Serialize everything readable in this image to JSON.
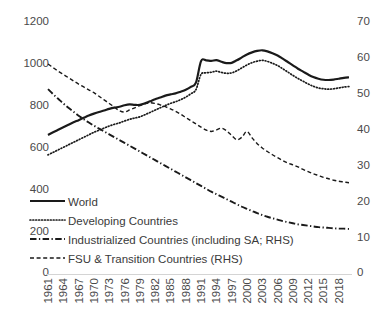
{
  "chart_data": {
    "type": "line",
    "title": "",
    "xlabel": "",
    "ylabel": "",
    "y2label": "",
    "ylim": [
      0,
      1200
    ],
    "y2lim": [
      0,
      70
    ],
    "grid": false,
    "legend_position": "inside-lower-left",
    "x": [
      1961,
      1962,
      1963,
      1964,
      1965,
      1966,
      1967,
      1968,
      1969,
      1970,
      1971,
      1972,
      1973,
      1974,
      1975,
      1976,
      1977,
      1978,
      1979,
      1980,
      1981,
      1982,
      1983,
      1984,
      1985,
      1986,
      1987,
      1988,
      1989,
      1990,
      1991,
      1992,
      1993,
      1994,
      1995,
      1996,
      1997,
      1998,
      1999,
      2000,
      2001,
      2002,
      2003,
      2004,
      2005,
      2006,
      2007,
      2008,
      2009,
      2010,
      2011,
      2012,
      2013,
      2014,
      2015,
      2016,
      2017,
      2018,
      2019,
      2020
    ],
    "tick_labels_x": [
      "1961",
      "1964",
      "1967",
      "1970",
      "1973",
      "1976",
      "1979",
      "1982",
      "1985",
      "1988",
      "1991",
      "1994",
      "1997",
      "2000",
      "2003",
      "2006",
      "2009",
      "2012",
      "2015",
      "2018"
    ],
    "tick_labels_y_left": [
      "1200",
      "1000",
      "800",
      "600",
      "400",
      "200",
      "0"
    ],
    "tick_labels_y_right": [
      "70",
      "60",
      "50",
      "40",
      "30",
      "20",
      "10",
      "0"
    ],
    "series": [
      {
        "name": "World",
        "axis": "left",
        "style": "solid",
        "values": [
          655,
          668,
          680,
          692,
          704,
          716,
          726,
          737,
          748,
          757,
          765,
          772,
          780,
          786,
          790,
          797,
          801,
          799,
          799,
          806,
          816,
          826,
          834,
          843,
          849,
          854,
          862,
          871,
          885,
          905,
          1008,
          1012,
          1009,
          1013,
          1005,
          999,
          1000,
          1012,
          1026,
          1040,
          1050,
          1057,
          1060,
          1055,
          1046,
          1035,
          1020,
          1004,
          988,
          972,
          958,
          944,
          932,
          924,
          919,
          918,
          920,
          924,
          928,
          931
        ]
      },
      {
        "name": "Developing Countries",
        "axis": "left",
        "style": "dotted",
        "values": [
          560,
          572,
          584,
          596,
          608,
          620,
          632,
          644,
          656,
          668,
          678,
          688,
          698,
          706,
          713,
          722,
          730,
          736,
          742,
          752,
          763,
          774,
          785,
          796,
          806,
          814,
          824,
          836,
          852,
          872,
          945,
          952,
          955,
          960,
          954,
          950,
          952,
          962,
          976,
          990,
          1001,
          1008,
          1012,
          1007,
          998,
          987,
          972,
          956,
          940,
          925,
          912,
          899,
          888,
          880,
          876,
          874,
          876,
          880,
          884,
          887
        ]
      },
      {
        "name": "Industrialized Countries (including SA; RHS)",
        "axis": "right",
        "style": "dashdot",
        "values": [
          51.0,
          49.6,
          48.3,
          47.0,
          45.8,
          44.7,
          43.6,
          42.6,
          41.7,
          40.8,
          40.0,
          39.2,
          38.4,
          37.6,
          36.8,
          36.0,
          35.2,
          34.4,
          33.6,
          32.8,
          32.0,
          31.2,
          30.4,
          29.6,
          28.8,
          28.0,
          27.2,
          26.4,
          25.6,
          24.8,
          24.0,
          23.2,
          22.4,
          21.7,
          21.0,
          20.3,
          19.6,
          18.9,
          18.2,
          17.6,
          17.0,
          16.4,
          15.9,
          15.4,
          15.0,
          14.6,
          14.2,
          13.9,
          13.6,
          13.3,
          13.1,
          12.9,
          12.7,
          12.5,
          12.4,
          12.3,
          12.2,
          12.1,
          12.1,
          12.0
        ]
      },
      {
        "name": "FSU & Transition Countries (RHS)",
        "axis": "right",
        "style": "dashed",
        "values": [
          58.0,
          57.0,
          56.0,
          55.1,
          54.2,
          53.3,
          52.4,
          51.6,
          50.8,
          50.0,
          49.0,
          48.0,
          47.0,
          46.0,
          45.0,
          44.6,
          45.2,
          45.8,
          46.4,
          46.9,
          47.2,
          47.0,
          46.6,
          46.1,
          45.5,
          44.8,
          44.0,
          43.1,
          42.2,
          41.3,
          40.4,
          39.6,
          39.2,
          39.6,
          40.1,
          39.4,
          38.1,
          36.9,
          37.6,
          39.2,
          37.4,
          35.8,
          34.6,
          33.6,
          32.7,
          31.9,
          31.1,
          30.4,
          29.9,
          29.3,
          28.6,
          28.0,
          27.4,
          26.9,
          26.4,
          26.0,
          25.6,
          25.3,
          25.1,
          24.9
        ]
      }
    ]
  },
  "legend": {
    "items": [
      {
        "label": "World",
        "style": "solid"
      },
      {
        "label": "Developing Countries",
        "style": "dotted"
      },
      {
        "label": "Industrialized Countries (including SA; RHS)",
        "style": "dashdot"
      },
      {
        "label": "FSU & Transition Countries (RHS)",
        "style": "dashed"
      }
    ]
  },
  "colors": {
    "line": "#1a1a1a",
    "text": "#404040",
    "axis": "#d4d4d4"
  }
}
